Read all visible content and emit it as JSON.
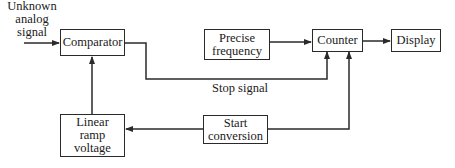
{
  "input": {
    "label_lines": [
      "Unknown",
      "analog",
      "signal"
    ]
  },
  "blocks": {
    "comparator": {
      "lines": [
        "Comparator"
      ]
    },
    "precise_frequency": {
      "lines": [
        "Precise",
        "frequency"
      ]
    },
    "counter": {
      "lines": [
        "Counter"
      ]
    },
    "display": {
      "lines": [
        "Display"
      ]
    },
    "linear_ramp": {
      "lines": [
        "Linear",
        "ramp",
        "voltage"
      ]
    },
    "start_conversion": {
      "lines": [
        "Start",
        "conversion"
      ]
    }
  },
  "signals": {
    "stop_signal": "Stop signal"
  },
  "colors": {
    "line": "#2a2a2a",
    "background": "#ffffff"
  }
}
